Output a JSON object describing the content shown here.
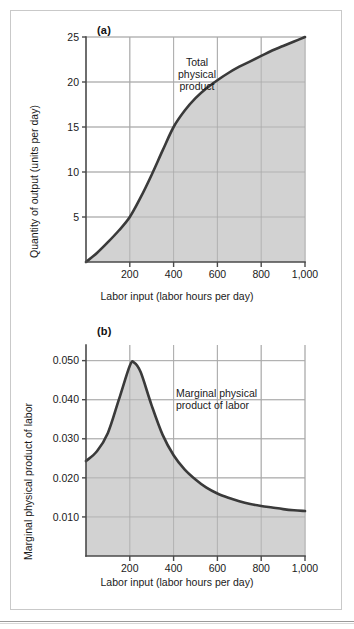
{
  "figure": {
    "panel_a_tag": "(a)",
    "panel_b_tag": "(b)"
  },
  "chart_data": [
    {
      "type": "area",
      "panel": "(a)",
      "title": "",
      "annotation": "Total physical product",
      "annotation_lines": [
        "Total",
        "physical",
        "product"
      ],
      "xlabel": "Labor input (labor hours per day)",
      "ylabel": "Quantity of output (units per day)",
      "xlim": [
        0,
        1000
      ],
      "ylim": [
        0,
        25
      ],
      "xticks": [
        200,
        400,
        600,
        800,
        1000
      ],
      "xtick_labels": [
        "200",
        "400",
        "600",
        "800",
        "1,000"
      ],
      "yticks": [
        5,
        10,
        15,
        20,
        25
      ],
      "ytick_labels": [
        "5",
        "10",
        "15",
        "20",
        "25"
      ],
      "grid": true,
      "legend": "none",
      "series": [
        {
          "name": "Total physical product",
          "x": [
            0,
            50,
            100,
            150,
            200,
            250,
            300,
            350,
            400,
            450,
            500,
            550,
            600,
            650,
            700,
            750,
            800,
            850,
            900,
            950,
            1000
          ],
          "y": [
            0,
            1.0,
            2.2,
            3.5,
            5.0,
            7.2,
            9.7,
            12.4,
            15.0,
            16.8,
            18.2,
            19.3,
            20.2,
            21.0,
            21.7,
            22.3,
            22.9,
            23.5,
            24.0,
            24.5,
            25.0
          ]
        }
      ]
    },
    {
      "type": "area",
      "panel": "(b)",
      "title": "",
      "annotation": "Marginal physical product of labor",
      "annotation_lines": [
        "Marginal physical",
        "product of labor"
      ],
      "xlabel": "Labor input (labor hours per day)",
      "ylabel": "Marginal physical product of labor",
      "xlim": [
        0,
        1000
      ],
      "ylim": [
        0,
        0.054
      ],
      "xticks": [
        200,
        400,
        600,
        800,
        1000
      ],
      "xtick_labels": [
        "200",
        "400",
        "600",
        "800",
        "1,000"
      ],
      "yticks": [
        0.01,
        0.02,
        0.03,
        0.04,
        0.05
      ],
      "ytick_labels": [
        "0.010",
        "0.020",
        "0.030",
        "0.040",
        "0.050"
      ],
      "grid": true,
      "legend": "none",
      "series": [
        {
          "name": "Marginal physical product of labor",
          "x": [
            0,
            50,
            100,
            150,
            200,
            220,
            250,
            300,
            350,
            400,
            450,
            500,
            550,
            600,
            650,
            700,
            750,
            800,
            850,
            900,
            950,
            1000
          ],
          "y": [
            0.0243,
            0.0268,
            0.0315,
            0.04,
            0.0487,
            0.0495,
            0.047,
            0.0385,
            0.031,
            0.0258,
            0.0222,
            0.0196,
            0.0175,
            0.016,
            0.0149,
            0.014,
            0.0133,
            0.0128,
            0.0124,
            0.012,
            0.0117,
            0.0115
          ]
        }
      ]
    }
  ],
  "colors": {
    "curve": "#3a3a3a",
    "fill": "#d2d2d2",
    "grid": "#a9a9a9",
    "axis": "#4a4a4a",
    "border": "#c9c9c9",
    "background": "#ffffff"
  }
}
